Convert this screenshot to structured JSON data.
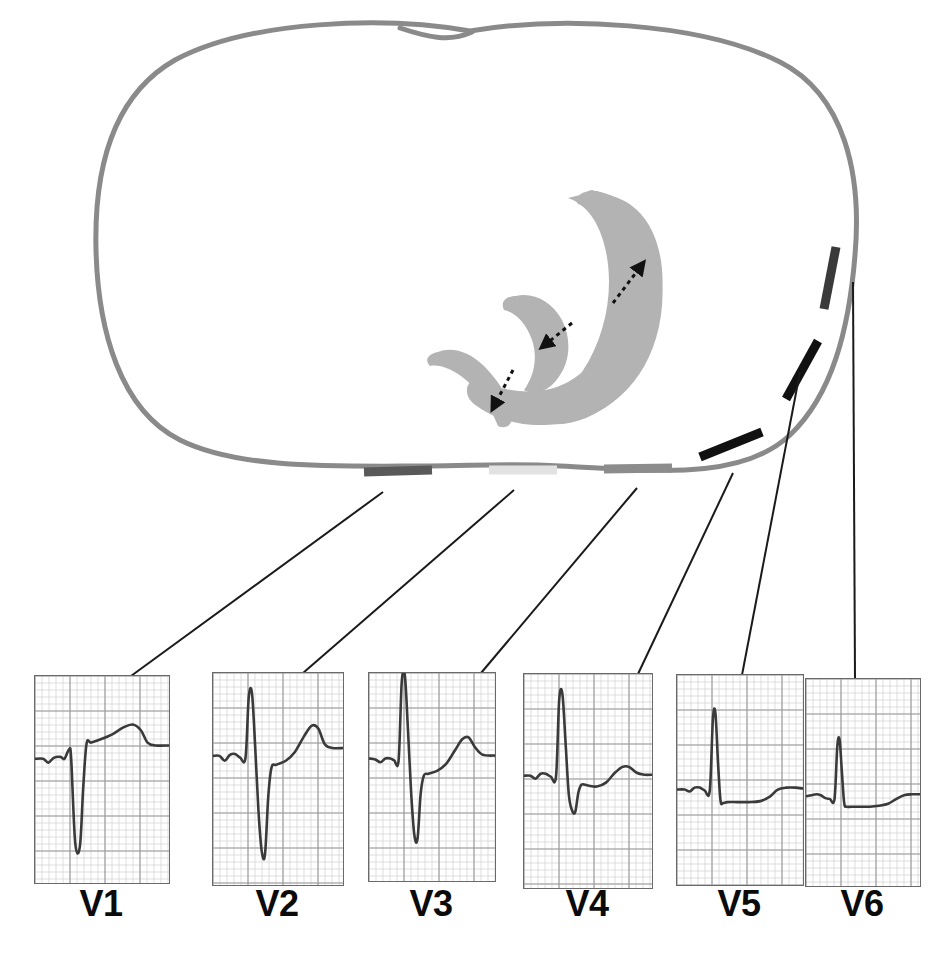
{
  "figure": {
    "kind": "medical-diagram",
    "background_color": "#ffffff"
  },
  "torso": {
    "name": "chest-cross-section-outline",
    "stroke_color": "#8a8a8a",
    "stroke_width": 5,
    "fill": "none"
  },
  "myocardium": {
    "name": "ventricular-myocardium",
    "fill_color": "#b3b3b3",
    "description": "horseshoe shaped ventricular wall cross section"
  },
  "vectors": [
    {
      "id": "vector-anterior",
      "label": "",
      "color": "#111111",
      "style": "dashed-arrow"
    },
    {
      "id": "vector-septal",
      "label": "",
      "color": "#111111",
      "style": "dashed-arrow"
    },
    {
      "id": "vector-inferior",
      "label": "",
      "color": "#111111",
      "style": "dashed-arrow"
    }
  ],
  "electrodes": [
    {
      "id": "electrode-v1",
      "lead": "V1",
      "color": "#595959",
      "x1": 364,
      "y1": 472,
      "x2": 432,
      "y2": 470
    },
    {
      "id": "electrode-v2",
      "lead": "V2",
      "color": "#e2e2e2",
      "x1": 489,
      "y1": 470,
      "x2": 557,
      "y2": 470
    },
    {
      "id": "electrode-v3",
      "lead": "V3",
      "color": "#8c8c8c",
      "x1": 604,
      "y1": 469,
      "x2": 672,
      "y2": 468
    },
    {
      "id": "electrode-v4",
      "lead": "V4",
      "color": "#111111",
      "x1": 700,
      "y1": 457,
      "x2": 762,
      "y2": 432
    },
    {
      "id": "electrode-v5",
      "lead": "V5",
      "color": "#111111",
      "x1": 786,
      "y1": 399,
      "x2": 818,
      "y2": 341
    },
    {
      "id": "electrode-v6",
      "lead": "V6",
      "color": "#3a3a3a",
      "x1": 824,
      "y1": 309,
      "x2": 836,
      "y2": 247
    }
  ],
  "leader_lines": {
    "color": "#1a1a1a",
    "width": 2,
    "lines": [
      {
        "id": "leader-v1",
        "from_x": 383,
        "from_y": 492,
        "to_x": 131,
        "to_y": 676
      },
      {
        "from_x": 0,
        "from_y": 0,
        "to_x": 0,
        "to_y": 0
      }
    ]
  },
  "strips": [
    {
      "id": "strip-v1",
      "label": "V1",
      "box": {
        "x": 34,
        "y": 675,
        "w": 134,
        "h": 207
      },
      "label_x": 101,
      "label_y": 886,
      "leader": {
        "from_x": 383,
        "from_y": 492,
        "to_x": 131,
        "to_y": 676
      },
      "morphology": "rS",
      "description": "small r wave, deep wide S wave, broad upright T wave",
      "baseline_frac": 0.4
    },
    {
      "id": "strip-v2",
      "label": "V2",
      "box": {
        "x": 212,
        "y": 672,
        "w": 130,
        "h": 212
      },
      "label_x": 277,
      "label_y": 886,
      "leader": {
        "from_x": 514,
        "from_y": 490,
        "to_x": 303,
        "to_y": 673
      },
      "morphology": "RS",
      "description": "tall R wave, deep S wave, tall upright T wave",
      "baseline_frac": 0.4
    },
    {
      "id": "strip-v3",
      "label": "V3",
      "box": {
        "x": 368,
        "y": 672,
        "w": 126,
        "h": 208
      },
      "label_x": 431,
      "label_y": 886,
      "leader": {
        "from_x": 637,
        "from_y": 488,
        "to_x": 481,
        "to_y": 673
      },
      "morphology": "RS",
      "description": "tall R wave with deep S wave, upright T wave",
      "baseline_frac": 0.42
    },
    {
      "id": "strip-v4",
      "label": "V4",
      "box": {
        "x": 523,
        "y": 673,
        "w": 128,
        "h": 214
      },
      "label_x": 587,
      "label_y": 886,
      "leader": {
        "from_x": 733,
        "from_y": 473,
        "to_x": 638,
        "to_y": 674
      },
      "morphology": "Rs",
      "description": "dominant R wave, small s wave, low upright T wave",
      "baseline_frac": 0.48
    },
    {
      "id": "strip-v5",
      "label": "V5",
      "box": {
        "x": 676,
        "y": 674,
        "w": 126,
        "h": 210
      },
      "label_x": 739,
      "label_y": 886,
      "leader": {
        "from_x": 800,
        "from_y": 372,
        "to_x": 742,
        "to_y": 675
      },
      "morphology": "R",
      "description": "tall narrow R wave, flat ST segment, small T wave",
      "baseline_frac": 0.55
    },
    {
      "id": "strip-v6",
      "label": "V6",
      "box": {
        "x": 805,
        "y": 678,
        "w": 114,
        "h": 207
      },
      "label_x": 862,
      "label_y": 886,
      "leader": {
        "from_x": 853,
        "from_y": 282,
        "to_x": 855,
        "to_y": 679
      },
      "morphology": "R",
      "description": "tall R wave, small s, low rounded T wave",
      "baseline_frac": 0.58
    }
  ],
  "grid": {
    "minor_color": "#c9c9c9",
    "major_color": "#9a9a9a",
    "minor_step": 7,
    "major_step": 35
  },
  "trace": {
    "color": "#3a3a3a",
    "width": 2.6
  }
}
